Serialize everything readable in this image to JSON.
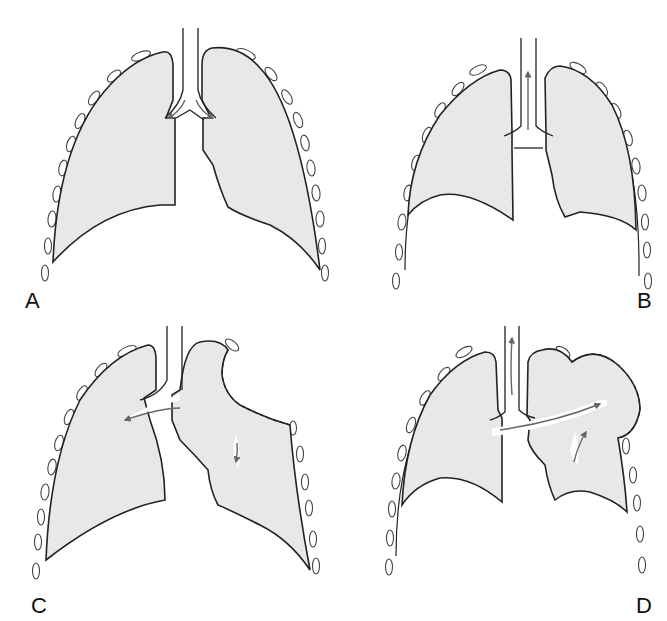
{
  "figure": {
    "panels": [
      {
        "id": "A",
        "label": "A",
        "description": "Normal lungs, air flowing into both lungs from trachea"
      },
      {
        "id": "B",
        "label": "B",
        "description": "Normal lungs, air flowing out through trachea"
      },
      {
        "id": "C",
        "label": "C",
        "description": "Flail segment collapses inward; air moves from affected lung to opposite lung"
      },
      {
        "id": "D",
        "label": "D",
        "description": "Flail segment bulges outward; air moves from opposite lung into affected lung and out trachea"
      }
    ],
    "colors": {
      "lung_fill": "#e8e8e8",
      "outline": "#222222",
      "arrow": "#666666",
      "background": "#ffffff"
    }
  }
}
